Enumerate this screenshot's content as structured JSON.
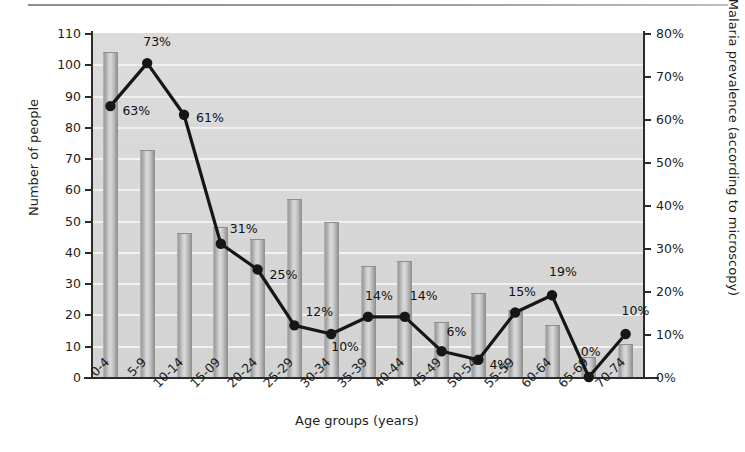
{
  "chart_data": {
    "type": "bar",
    "title": "",
    "xlabel": "Age groups (years)",
    "ylabel": "Number of people",
    "ylabel_right": "Malaria prevalence (according to microscopy)",
    "categories": [
      "0-4",
      "5-9",
      "10-14",
      "15-09",
      "20-24",
      "25-29",
      "30-34",
      "35-39",
      "40-44",
      "45-49",
      "50-54",
      "55-59",
      "60-64",
      "65-69",
      "70-74"
    ],
    "ylim": [
      0,
      110
    ],
    "ylim_right": [
      0,
      80
    ],
    "yticks": [
      0,
      10,
      20,
      30,
      40,
      50,
      60,
      70,
      80,
      90,
      100,
      110
    ],
    "ytick_labels": [
      "0",
      "10",
      "20",
      "30",
      "40",
      "50",
      "60",
      "70",
      "80",
      "90",
      "100",
      "110"
    ],
    "yticks_right": [
      0,
      10,
      20,
      30,
      40,
      50,
      60,
      70,
      80
    ],
    "ytick_labels_right": [
      "0%",
      "10%",
      "20%",
      "30%",
      "40%",
      "50%",
      "60%",
      "70%",
      "80%"
    ],
    "grid": true,
    "legend": false,
    "series": [
      {
        "name": "Number of people",
        "type": "bar",
        "axis": "left",
        "values": [
          104,
          72.5,
          46,
          48,
          44,
          57,
          49.5,
          35.5,
          37,
          17.5,
          27,
          21.5,
          16.5,
          6.5,
          10.5
        ]
      },
      {
        "name": "Malaria prevalence (according to microscopy)",
        "type": "line",
        "axis": "right",
        "values": [
          63,
          73,
          61,
          31,
          25,
          12,
          10,
          14,
          14,
          6,
          4,
          15,
          19,
          0,
          10
        ],
        "labels": [
          "63%",
          "73%",
          "61%",
          "31%",
          "25%",
          "12%",
          "10%",
          "14%",
          "14%",
          "6%",
          "4%",
          "15%",
          "19%",
          "0%",
          "10%"
        ],
        "marker": "circle",
        "color": "#161616"
      }
    ],
    "label_offsets": [
      {
        "dx": 12,
        "dy": 4
      },
      {
        "dx": -4,
        "dy": -22
      },
      {
        "dx": 12,
        "dy": 2
      },
      {
        "dx": 9,
        "dy": -16
      },
      {
        "dx": 12,
        "dy": 4
      },
      {
        "dx": 11,
        "dy": -14
      },
      {
        "dx": 0,
        "dy": 12
      },
      {
        "dx": -3,
        "dy": -22
      },
      {
        "dx": 5,
        "dy": -22
      },
      {
        "dx": 5,
        "dy": -20
      },
      {
        "dx": 11,
        "dy": 4
      },
      {
        "dx": -7,
        "dy": -22
      },
      {
        "dx": -3,
        "dy": -24
      },
      {
        "dx": -8,
        "dy": -26
      },
      {
        "dx": -4,
        "dy": -24
      }
    ],
    "colors": {
      "plot_background": "#d8d8d8",
      "gridline": "#f2f2f2",
      "axis": "#2b2b2b",
      "bar": "#b4b4b4",
      "line": "#161616",
      "text": "#1d1d1d"
    }
  }
}
